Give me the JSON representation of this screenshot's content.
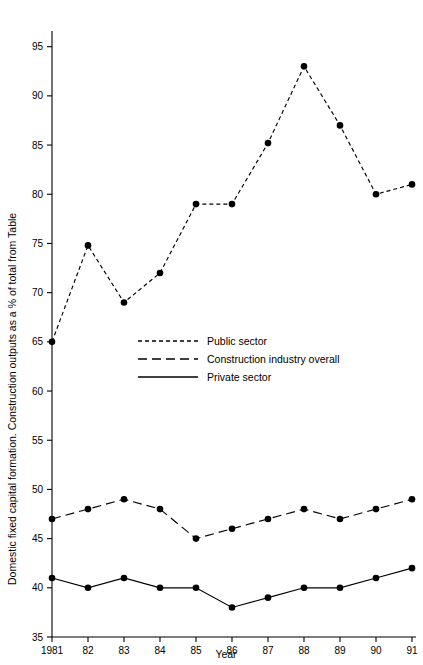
{
  "chart_data": {
    "type": "line",
    "title": "",
    "xlabel": "Year",
    "ylabel": "Domestic fixed capital formation. Construction outputs as a % of total from Table",
    "categories": [
      "1981",
      "82",
      "83",
      "84",
      "85",
      "86",
      "87",
      "88",
      "89",
      "90",
      "91"
    ],
    "x": [
      1981,
      1982,
      1983,
      1984,
      1985,
      1986,
      1987,
      1988,
      1989,
      1990,
      1991
    ],
    "xlim": [
      1981,
      1991
    ],
    "ylim": [
      35,
      97
    ],
    "ytick_labels": [
      "95",
      "90",
      "85",
      "80",
      "75",
      "70",
      "65",
      "60",
      "55",
      "50",
      "45",
      "40",
      "35"
    ],
    "yticks": [
      95,
      90,
      85,
      80,
      75,
      70,
      65,
      60,
      55,
      50,
      45,
      40,
      35
    ],
    "grid": false,
    "legend_position": "center-left",
    "series": [
      {
        "name": "Public sector",
        "style": "short-dash",
        "dasharray": "4,3",
        "color": "#000000",
        "values": [
          65,
          74.8,
          69,
          72,
          79,
          79,
          85.2,
          93,
          87,
          80,
          81
        ]
      },
      {
        "name": "Construction industry overall",
        "style": "long-dash",
        "dasharray": "9,5",
        "color": "#000000",
        "values": [
          47,
          48,
          49,
          48,
          45,
          46,
          47,
          48,
          47,
          48,
          49
        ]
      },
      {
        "name": "Private sector",
        "style": "solid",
        "dasharray": "none",
        "color": "#000000",
        "values": [
          41,
          40,
          41,
          40,
          40,
          38,
          39,
          40,
          40,
          41,
          42
        ]
      }
    ]
  },
  "axes": {
    "y_axis_title": "Domestic fixed capital formation. Construction outputs as a % of total from Table",
    "x_axis_title": "Year"
  },
  "legend": {
    "entries": [
      {
        "label": "Public sector"
      },
      {
        "label": "Construction industry overall"
      },
      {
        "label": "Private sector"
      }
    ]
  }
}
